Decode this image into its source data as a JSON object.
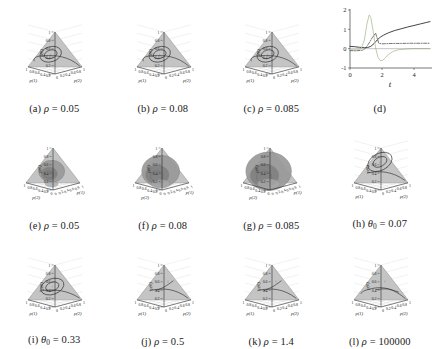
{
  "figure": {
    "type": "multi-panel-scientific-figure",
    "rows": 3,
    "cols": 4,
    "panel_count": 12
  },
  "colors": {
    "triangle_fill": "#c4c4c4",
    "triangle_edge": "#8c8c8c",
    "surface_fill": "#9a9a9a",
    "surface_dark": "#7d7d7d",
    "trajectory": "#2a2a2a",
    "grid": "#cfcfcf",
    "axis": "#1e1e1e",
    "curve_solid": "#3b3b3b",
    "curve_light": "#b9c9a8",
    "curve_dashdot": "#4a4a4a",
    "background": "#ffffff"
  },
  "simplex_axes": {
    "vertical_label": "p(0)",
    "vertical_ticks": [
      "1",
      "0.8",
      "0.6",
      "0.4",
      "0.2",
      "0"
    ],
    "left_label": "p(1)",
    "left_ticks": [
      "0.2",
      "0.4",
      "0.6",
      "0.8",
      "1"
    ],
    "right_label": "p(2)",
    "right_ticks": [
      "0",
      "0.2",
      "0.4",
      "0.6",
      "0.8",
      "1"
    ]
  },
  "rotated_axes": {
    "vertical_label": "p(0)",
    "vertical_ticks": [
      "1",
      "0.8",
      "0.6",
      "0.4",
      "0.2",
      "0"
    ],
    "left_label": "p(2)",
    "left_ticks": [
      "1",
      "0.8",
      "0.6",
      "0.4",
      "0.2",
      "0"
    ],
    "right_label": "p(1)",
    "right_ticks": [
      "0",
      "0.2",
      "0.4",
      "0.6",
      "0.8",
      "1"
    ]
  },
  "panels": [
    {
      "id": "a",
      "letter": "(a)",
      "param": "ρ",
      "eq": "=",
      "value": "0.05",
      "view": "simplex",
      "style": "closed-orbit-small"
    },
    {
      "id": "b",
      "letter": "(b)",
      "param": "ρ",
      "eq": "=",
      "value": "0.08",
      "view": "simplex",
      "style": "closed-orbit-small"
    },
    {
      "id": "c",
      "letter": "(c)",
      "param": "ρ",
      "eq": "=",
      "value": "0.085",
      "view": "simplex",
      "style": "closed-orbit-small"
    },
    {
      "id": "d",
      "letter": "(d)",
      "param": "",
      "eq": "",
      "value": "",
      "view": "timeseries",
      "style": "line-plot"
    },
    {
      "id": "e",
      "letter": "(e)",
      "param": "ρ",
      "eq": "=",
      "value": "0.05",
      "view": "rotated",
      "style": "blob-small"
    },
    {
      "id": "f",
      "letter": "(f)",
      "param": "ρ",
      "eq": "=",
      "value": "0.08",
      "view": "rotated",
      "style": "blob-medium"
    },
    {
      "id": "g",
      "letter": "(g)",
      "param": "ρ",
      "eq": "=",
      "value": "0.085",
      "view": "rotated",
      "style": "blob-large"
    },
    {
      "id": "h",
      "letter": "(h)",
      "param": "θ",
      "sub": "0",
      "eq": "=",
      "value": "0.07",
      "view": "simplex",
      "style": "orbit-upper"
    },
    {
      "id": "i",
      "letter": "(i)",
      "param": "θ",
      "sub": "0",
      "eq": "=",
      "value": "0.33",
      "view": "simplex",
      "style": "orbit-lower"
    },
    {
      "id": "j",
      "letter": "(j)",
      "param": "ρ",
      "eq": "=",
      "value": "0.5",
      "view": "simplex",
      "style": "spiral-in"
    },
    {
      "id": "k",
      "letter": "(k)",
      "param": "ρ",
      "eq": "=",
      "value": "1.4",
      "view": "simplex",
      "style": "spiral-in"
    },
    {
      "id": "l",
      "letter": "(l)",
      "param": "ρ",
      "eq": "=",
      "value": "100000",
      "view": "simplex",
      "style": "arc-edge"
    }
  ],
  "chart_data": {
    "type": "line",
    "panel": "d",
    "title": "",
    "xlabel": "t",
    "ylabel": "",
    "xlim": [
      0,
      5
    ],
    "ylim": [
      -1,
      2
    ],
    "xticks": [
      "0",
      "2",
      "4"
    ],
    "yticks": [
      "2",
      "1",
      "0",
      "-1"
    ],
    "grid": false,
    "legend": "none",
    "series": [
      {
        "name": "solid-rising",
        "style": "solid",
        "color": "#3b3b3b",
        "x": [
          0,
          0.3,
          0.6,
          0.9,
          1.1,
          1.3,
          1.5,
          1.7,
          1.9,
          2.1,
          2.4,
          2.8,
          3.2,
          3.6,
          4.0,
          4.4,
          4.8,
          5.0
        ],
        "y": [
          0.12,
          0.1,
          0.07,
          0.05,
          0.06,
          0.12,
          0.26,
          0.45,
          0.6,
          0.7,
          0.82,
          0.94,
          1.03,
          1.12,
          1.2,
          1.28,
          1.36,
          1.4
        ]
      },
      {
        "name": "light-spike",
        "style": "solid",
        "color": "#b9c9a8",
        "x": [
          0,
          0.4,
          0.7,
          0.9,
          1.05,
          1.2,
          1.3,
          1.45,
          1.6,
          1.75,
          1.9,
          2.05,
          2.2,
          2.4,
          2.7,
          3.0,
          3.5,
          4.0,
          4.5,
          5.0
        ],
        "y": [
          -0.06,
          -0.06,
          0.0,
          0.45,
          1.25,
          1.75,
          1.6,
          0.9,
          0.05,
          -0.45,
          -0.62,
          -0.6,
          -0.48,
          -0.3,
          -0.14,
          -0.06,
          -0.02,
          0.0,
          0.0,
          0.0
        ]
      },
      {
        "name": "dash-dot",
        "style": "dashdot",
        "color": "#4a4a4a",
        "x": [
          0,
          0.4,
          0.8,
          1.0,
          1.2,
          1.4,
          1.6,
          1.8,
          2.0,
          2.3,
          2.7,
          3.2,
          3.8,
          4.4,
          5.0
        ],
        "y": [
          -0.1,
          -0.11,
          -0.08,
          0.05,
          0.3,
          0.58,
          0.8,
          0.28,
          0.25,
          0.26,
          0.27,
          0.27,
          0.28,
          0.28,
          0.28
        ]
      },
      {
        "name": "zero-baseline",
        "style": "solid",
        "color": "#8e8e8e",
        "x": [
          0,
          5
        ],
        "y": [
          0,
          0
        ]
      }
    ]
  }
}
